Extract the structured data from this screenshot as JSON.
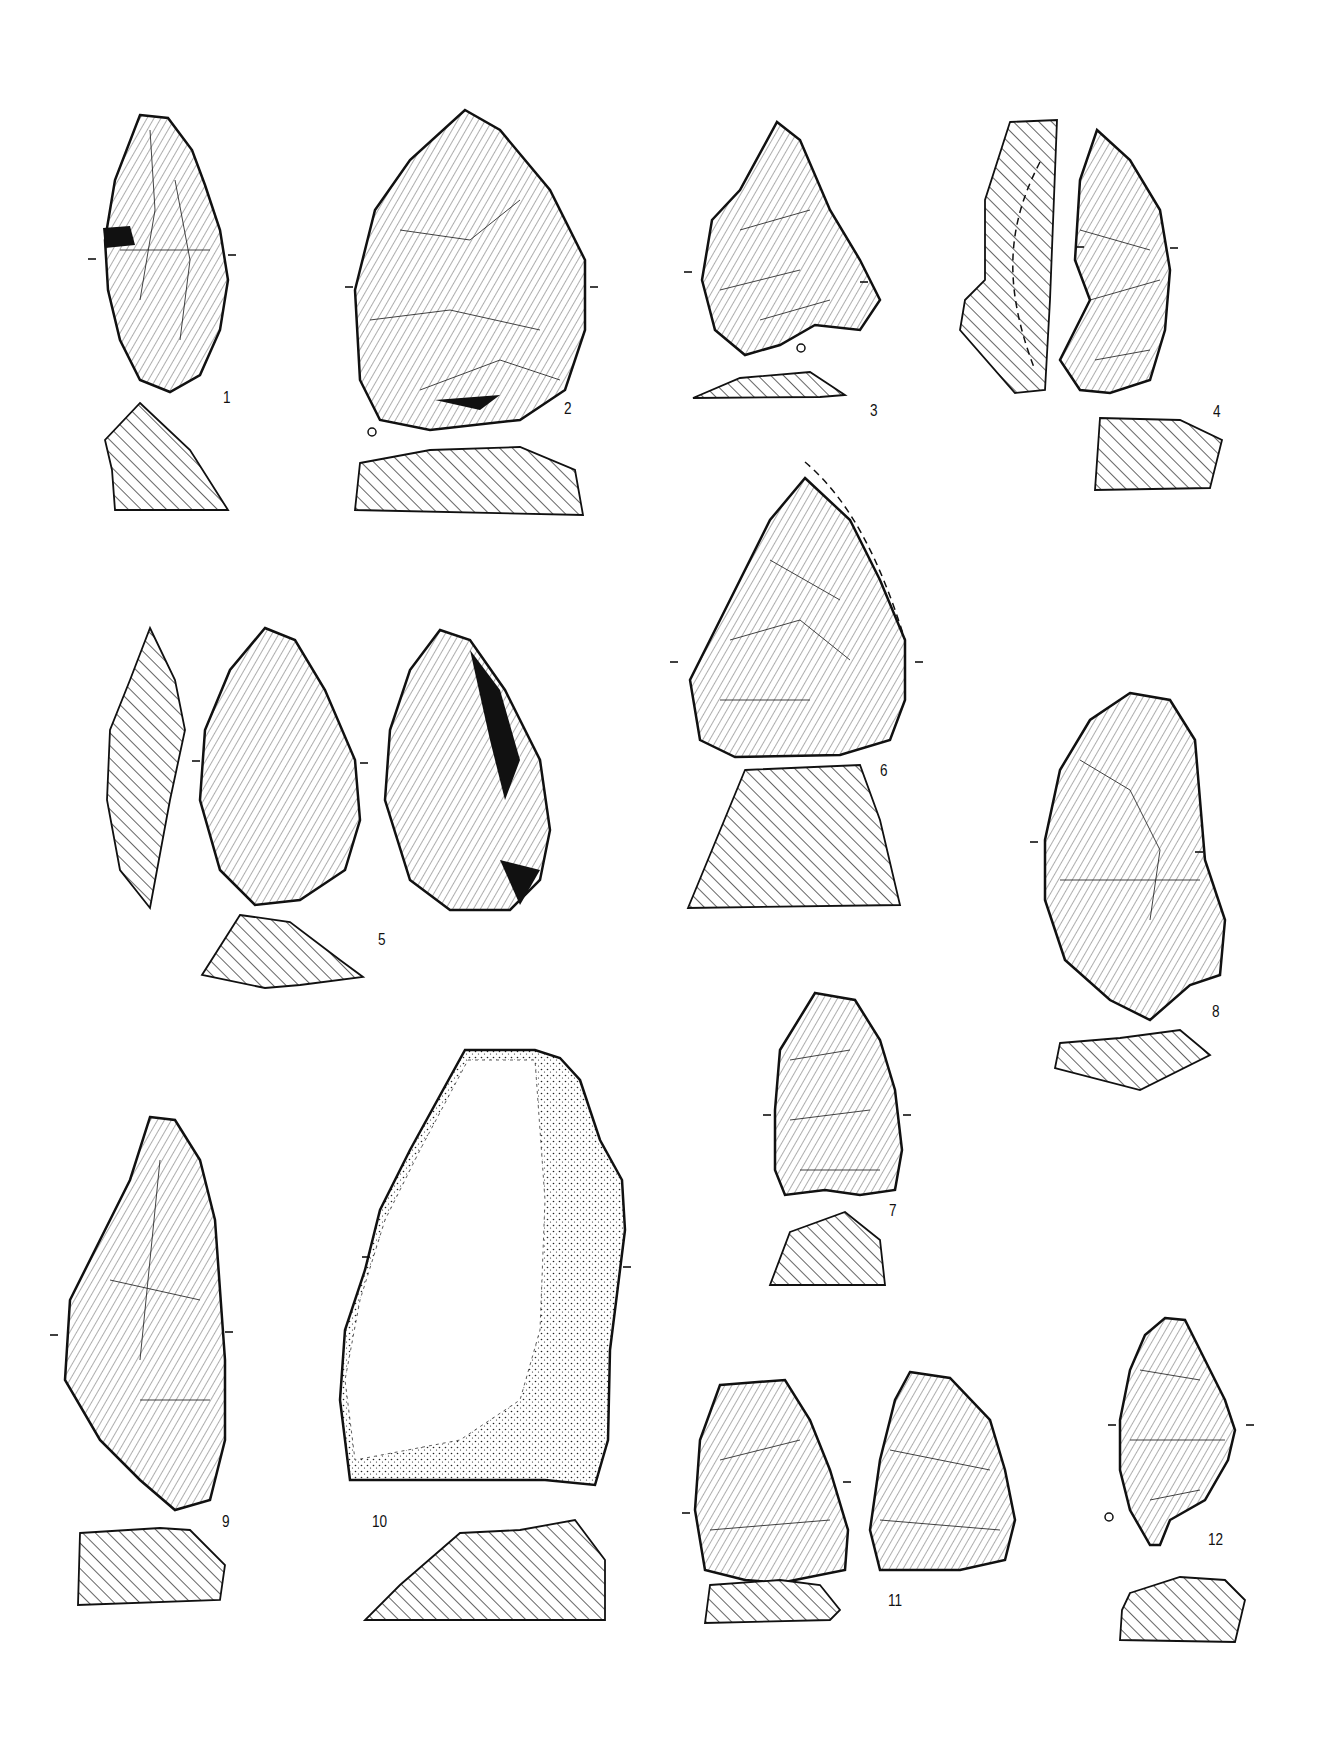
{
  "plate": {
    "description": "Archaeological plate of stone tools (lithic artifacts) with views and hatched cross-sections",
    "figures": [
      {
        "id": "fig-1",
        "label": "1"
      },
      {
        "id": "fig-2",
        "label": "2"
      },
      {
        "id": "fig-3",
        "label": "3"
      },
      {
        "id": "fig-4",
        "label": "4"
      },
      {
        "id": "fig-5",
        "label": "5"
      },
      {
        "id": "fig-6",
        "label": "6"
      },
      {
        "id": "fig-7",
        "label": "7"
      },
      {
        "id": "fig-8",
        "label": "8"
      },
      {
        "id": "fig-9",
        "label": "9"
      },
      {
        "id": "fig-10",
        "label": "10"
      },
      {
        "id": "fig-11",
        "label": "11"
      },
      {
        "id": "fig-12",
        "label": "12"
      }
    ],
    "symbols": {
      "section_tick": "-",
      "platform_marker": "o"
    }
  }
}
